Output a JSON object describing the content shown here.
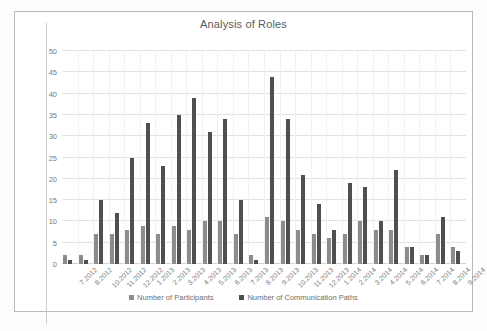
{
  "chart_data": {
    "type": "bar",
    "title": "Analysis of Roles",
    "xlabel": "",
    "ylabel": "",
    "ylim": [
      0,
      50
    ],
    "yticks": [
      0,
      5,
      10,
      15,
      20,
      25,
      30,
      35,
      40,
      45,
      50
    ],
    "grid": true,
    "legend_position": "bottom",
    "categories": [
      "7.2012",
      "8.2012",
      "10.2012",
      "11.2012",
      "12.2012",
      "1.2013",
      "2.2013",
      "3.2013",
      "4.2013",
      "5.2013",
      "6.2013",
      "7.2013",
      "8.2013",
      "9.2013",
      "10.2013",
      "11.2013",
      "12.2013",
      "1.2014",
      "2.2014",
      "3.2014",
      "4.2014",
      "5.2014",
      "6.2014",
      "7.2014",
      "8.2014",
      "9.2014"
    ],
    "series": [
      {
        "name": "Number of Participants",
        "color": "#8c8c8c",
        "values": [
          2,
          2,
          7,
          7,
          8,
          9,
          7,
          9,
          8,
          10,
          10,
          7,
          2,
          11,
          10,
          8,
          7,
          6,
          7,
          10,
          8,
          8,
          4,
          2,
          7,
          4
        ]
      },
      {
        "name": "Number of Communication Paths",
        "color": "#4f4f4f",
        "values": [
          1,
          1,
          15,
          12,
          25,
          33,
          23,
          35,
          39,
          31,
          34,
          15,
          1,
          44,
          34,
          21,
          14,
          8,
          19,
          18,
          10,
          22,
          4,
          2,
          11,
          3
        ]
      }
    ]
  },
  "legend": {
    "items": [
      {
        "label": "Number of Participants",
        "color": "#8c8c8c"
      },
      {
        "label": "Number of Communication Paths",
        "color": "#4f4f4f"
      }
    ]
  },
  "colors": {
    "series_1": "#8c8c8c",
    "series_2": "#4f4f4f",
    "grid": "#e2e2e2",
    "text": "#7a7a7a",
    "frame": "#b9b9b9",
    "background": "#ffffff"
  }
}
